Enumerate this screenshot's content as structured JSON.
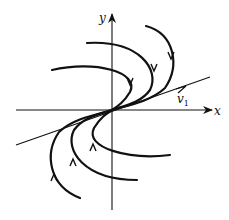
{
  "figure": {
    "type": "phase-portrait",
    "axes": {
      "x_label": "x",
      "y_label": "y"
    },
    "eigenvector": {
      "label": "v",
      "subscript": "1"
    },
    "trajectories_count": 6,
    "stroke_color": "#111111",
    "background_color": "#ffffff"
  }
}
